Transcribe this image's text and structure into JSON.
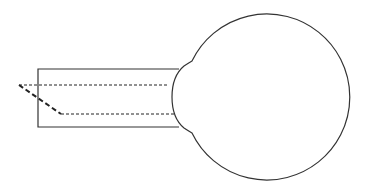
{
  "diagram": {
    "colors": {
      "background": "#ffffff",
      "stroke": "#333333",
      "dashed": "#222222"
    },
    "shapes": {
      "tube": {
        "x": 38,
        "y": 69,
        "width": 143,
        "height": 58
      },
      "bulb": {
        "cx": 267,
        "cy": 97,
        "r": 83
      },
      "upper_dashed_line": {
        "x1": 19,
        "y1": 85,
        "x2": 168,
        "y2": 85
      },
      "diagonal_dashed_line": {
        "x1": 19,
        "y1": 85,
        "x2": 61,
        "y2": 114
      },
      "lower_dashed_line": {
        "x1": 61,
        "y1": 114,
        "x2": 174,
        "y2": 114
      }
    }
  }
}
